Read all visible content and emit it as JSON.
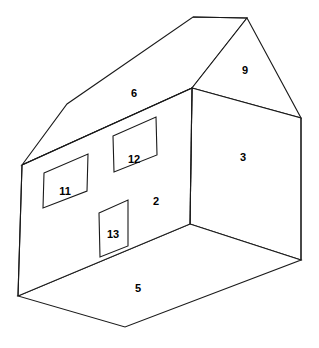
{
  "diagram": {
    "type": "line-diagram",
    "background_color": "#ffffff",
    "stroke_color": "#1a1a1a",
    "label_color": "#000000",
    "canvas": {
      "width": 319,
      "height": 348
    },
    "faces": [
      {
        "id": "front-wall",
        "label": "2",
        "name": "front-wall-face",
        "label_x": 156,
        "label_y": 201,
        "points": "22,165 192,88 190,224 18,296"
      },
      {
        "id": "right-wall",
        "label": "3",
        "name": "right-wall-face",
        "label_x": 243,
        "label_y": 157,
        "points": "192,88 301,118 301,260 190,224"
      },
      {
        "id": "floor",
        "label": "5",
        "name": "floor-face",
        "label_x": 138,
        "label_y": 288,
        "points": "18,296 190,224 301,260 125,327"
      },
      {
        "id": "roof-slope",
        "label": "6",
        "name": "roof-slope-face",
        "label_x": 134,
        "label_y": 93,
        "points": "22,165 67,104 193,17 247,18 192,88"
      },
      {
        "id": "gable",
        "label": "9",
        "name": "gable-face",
        "label_x": 245,
        "label_y": 70,
        "points": "192,88 247,18 301,118"
      }
    ],
    "openings": [
      {
        "id": "window-left",
        "label": "11",
        "name": "window-left",
        "label_x": 65,
        "label_y": 191,
        "points": "44,173 88,154 87,191 43,208"
      },
      {
        "id": "window-right",
        "label": "12",
        "name": "window-right",
        "label_x": 134,
        "label_y": 159,
        "points": "113,136 156,117 157,155 114,172"
      },
      {
        "id": "door",
        "label": "13",
        "name": "door",
        "label_x": 113,
        "label_y": 234,
        "points": "99,213 128,200 128,246 100,257"
      }
    ]
  }
}
